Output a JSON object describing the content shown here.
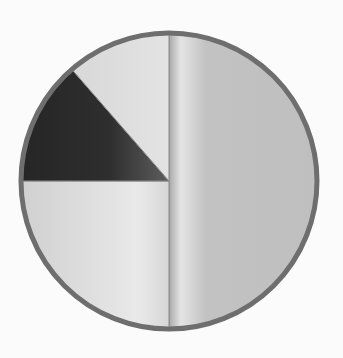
{
  "chart_data": {
    "type": "pie",
    "title": "",
    "start_angle_deg": 0,
    "direction": "clockwise",
    "center": [
      169,
      181
    ],
    "radius": 148,
    "slices": [
      {
        "name": "Right half",
        "value": 50,
        "color": "#bdbdbd",
        "highlight": "#e6e6e6"
      },
      {
        "name": "Bottom-left quarter",
        "value": 25,
        "color": "#d4d4d4",
        "highlight": "#ececec"
      },
      {
        "name": "Dark wedge",
        "value": 13.6,
        "color": "#2a2a2a",
        "highlight": "#5a5a5a"
      },
      {
        "name": "Top-left wedge",
        "value": 11.4,
        "color": "#d2d2d2",
        "highlight": "#e8e8e8"
      }
    ],
    "border_color": "#6e6e6e",
    "legend": "none"
  }
}
